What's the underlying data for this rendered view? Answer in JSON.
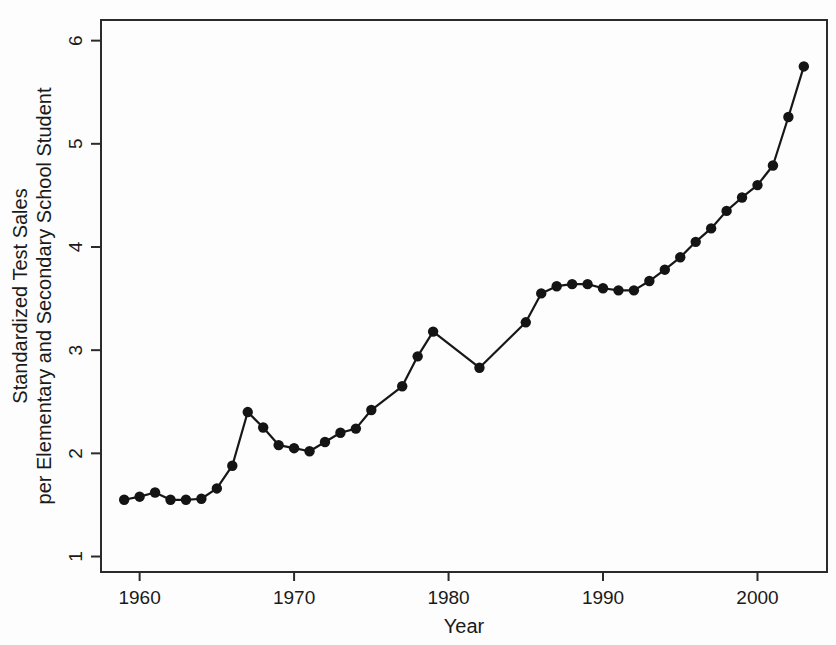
{
  "chart_data": {
    "type": "line",
    "title": "",
    "xlabel": "Year",
    "ylabel": "Standardized Test Sales per Elementary and Secondary School Student",
    "ylabel_line1": "Standardized Test Sales",
    "ylabel_line2": "per Elementary and Secondary School Student",
    "xlim": [
      1957.5,
      2004.5
    ],
    "ylim": [
      0.85,
      6.2
    ],
    "xticks": [
      1960,
      1970,
      1980,
      1990,
      2000
    ],
    "xtick_labels": [
      "1960",
      "1970",
      "1980",
      "1990",
      "2000"
    ],
    "yticks": [
      1,
      2,
      3,
      4,
      5,
      6
    ],
    "ytick_labels": [
      "1",
      "2",
      "3",
      "4",
      "5",
      "6"
    ],
    "grid": false,
    "legend": false,
    "marker": "filled-circle",
    "line_color": "#171717",
    "marker_color": "#141414",
    "background_color": "#fdfdfd",
    "x": [
      1959,
      1960,
      1961,
      1962,
      1963,
      1964,
      1965,
      1966,
      1967,
      1968,
      1969,
      1970,
      1971,
      1972,
      1973,
      1974,
      1977,
      1978,
      1979,
      1982,
      1985,
      1986,
      1987,
      1988,
      1989,
      1990,
      1991,
      1992,
      1993,
      1994,
      1995,
      1996,
      1997,
      1998,
      1999,
      2000,
      2001,
      2002,
      2003
    ],
    "y": [
      1.55,
      1.58,
      1.62,
      1.55,
      1.55,
      1.56,
      1.66,
      1.88,
      2.4,
      2.25,
      2.08,
      2.05,
      2.02,
      2.11,
      2.2,
      2.24,
      2.42,
      2.65,
      2.94,
      3.18,
      2.83,
      3.27,
      3.55,
      3.62,
      3.64,
      3.64,
      3.6,
      3.58,
      3.58,
      3.67,
      3.78,
      3.9,
      4.05,
      4.18,
      4.35,
      4.48,
      4.6,
      4.79,
      5.26,
      5.75
    ],
    "series": [
      {
        "name": "Standardized Test Sales per Student",
        "points": [
          {
            "year": 1959,
            "value": 1.55
          },
          {
            "year": 1960,
            "value": 1.58
          },
          {
            "year": 1961,
            "value": 1.62
          },
          {
            "year": 1962,
            "value": 1.55
          },
          {
            "year": 1963,
            "value": 1.55
          },
          {
            "year": 1964,
            "value": 1.56
          },
          {
            "year": 1965,
            "value": 1.66
          },
          {
            "year": 1966,
            "value": 1.88
          },
          {
            "year": 1967,
            "value": 2.4
          },
          {
            "year": 1968,
            "value": 2.25
          },
          {
            "year": 1969,
            "value": 2.08
          },
          {
            "year": 1970,
            "value": 2.05
          },
          {
            "year": 1971,
            "value": 2.02
          },
          {
            "year": 1972,
            "value": 2.11
          },
          {
            "year": 1973,
            "value": 2.2
          },
          {
            "year": 1974,
            "value": 2.24
          },
          {
            "year": 1975,
            "value": 2.42
          },
          {
            "year": 1977,
            "value": 2.65
          },
          {
            "year": 1978,
            "value": 2.94
          },
          {
            "year": 1979,
            "value": 3.18
          },
          {
            "year": 1982,
            "value": 2.83
          },
          {
            "year": 1985,
            "value": 3.27
          },
          {
            "year": 1986,
            "value": 3.55
          },
          {
            "year": 1987,
            "value": 3.62
          },
          {
            "year": 1988,
            "value": 3.64
          },
          {
            "year": 1989,
            "value": 3.64
          },
          {
            "year": 1990,
            "value": 3.6
          },
          {
            "year": 1991,
            "value": 3.58
          },
          {
            "year": 1992,
            "value": 3.58
          },
          {
            "year": 1993,
            "value": 3.67
          },
          {
            "year": 1994,
            "value": 3.78
          },
          {
            "year": 1995,
            "value": 3.9
          },
          {
            "year": 1996,
            "value": 4.05
          },
          {
            "year": 1997,
            "value": 4.18
          },
          {
            "year": 1998,
            "value": 4.35
          },
          {
            "year": 1999,
            "value": 4.48
          },
          {
            "year": 2000,
            "value": 4.6
          },
          {
            "year": 2001,
            "value": 4.79
          },
          {
            "year": 2002,
            "value": 5.26
          },
          {
            "year": 2003,
            "value": 5.75
          }
        ]
      }
    ]
  }
}
